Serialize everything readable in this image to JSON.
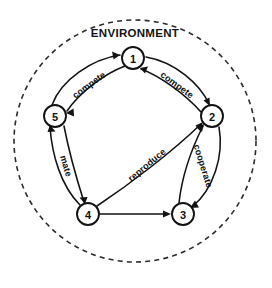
{
  "diagram": {
    "environment_label": "ENVIRONMENT",
    "boundary_style": "dashed-circle",
    "accent_color": "#131313",
    "background_color": "#ffffff",
    "nodes": [
      {
        "id": "1",
        "label": "1",
        "x": 133,
        "y": 58,
        "r": 11
      },
      {
        "id": "2",
        "label": "2",
        "x": 212,
        "y": 116,
        "r": 11
      },
      {
        "id": "3",
        "label": "3",
        "x": 183,
        "y": 214,
        "r": 11
      },
      {
        "id": "4",
        "label": "4",
        "x": 88,
        "y": 214,
        "r": 11
      },
      {
        "id": "5",
        "label": "5",
        "x": 55,
        "y": 116,
        "r": 11
      }
    ],
    "edges": [
      {
        "id": "e5-1",
        "from": "5",
        "to": "1",
        "label": "compete",
        "direction": "bidirectional",
        "label_x": 89,
        "label_y": 85,
        "label_rotation": -36
      },
      {
        "id": "e1-2",
        "from": "1",
        "to": "2",
        "label": "compete",
        "direction": "bidirectional",
        "label_x": 177,
        "label_y": 85,
        "label_rotation": 36
      },
      {
        "id": "e2-3",
        "from": "2",
        "to": "3",
        "label": "cooperate",
        "direction": "bidirectional",
        "label_x": 203,
        "label_y": 166,
        "label_rotation": 73
      },
      {
        "id": "e5-4",
        "from": "5",
        "to": "4",
        "label": "mate",
        "direction": "bidirectional",
        "label_x": 66,
        "label_y": 166,
        "label_rotation": 73
      },
      {
        "id": "e4-2",
        "from": "4",
        "to": "2",
        "label": "reproduce",
        "direction": "unidirectional",
        "label_x": 147,
        "label_y": 165,
        "label_rotation": -40
      },
      {
        "id": "e4-3",
        "from": "4",
        "to": "3",
        "label": "",
        "direction": "unidirectional",
        "label_x": 0,
        "label_y": 0,
        "label_rotation": 0
      }
    ]
  }
}
